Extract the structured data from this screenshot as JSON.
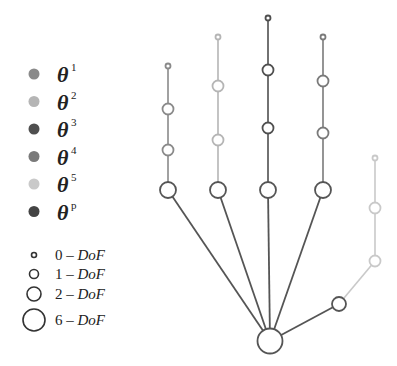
{
  "legend": {
    "colors": [
      {
        "label": "θ",
        "sup": "1",
        "color": "#8a8a8a"
      },
      {
        "label": "θ",
        "sup": "2",
        "color": "#b5b5b5"
      },
      {
        "label": "θ",
        "sup": "3",
        "color": "#4f4f4f"
      },
      {
        "label": "θ",
        "sup": "4",
        "color": "#7a7a7a"
      },
      {
        "label": "θ",
        "sup": "5",
        "color": "#c9c9c9"
      },
      {
        "label": "θ",
        "sup": "p",
        "color": "#444444"
      }
    ],
    "dof": [
      {
        "num": "0",
        "dash": "–",
        "label": "DoF",
        "radius": 2.5
      },
      {
        "num": "1",
        "dash": "–",
        "label": "DoF",
        "radius": 4.5
      },
      {
        "num": "2",
        "dash": "–",
        "label": "DoF",
        "radius": 7
      },
      {
        "num": "6",
        "dash": "–",
        "label": "DoF",
        "radius": 11
      }
    ]
  },
  "hand": {
    "palm": {
      "x": 270,
      "y": 341,
      "r": 12.5,
      "color": "#555555"
    },
    "fingers": [
      {
        "name": "finger-1",
        "color": "#8a8a8a",
        "nodes": [
          [
            168,
            190,
            8
          ],
          [
            168,
            150,
            5.5
          ],
          [
            168,
            109,
            5.5
          ],
          [
            168,
            66,
            2.5
          ]
        ]
      },
      {
        "name": "finger-2",
        "color": "#b5b5b5",
        "nodes": [
          [
            218,
            190,
            8
          ],
          [
            218,
            140,
            5.5
          ],
          [
            218,
            86,
            5.5
          ],
          [
            218,
            37,
            2.5
          ]
        ]
      },
      {
        "name": "finger-3",
        "color": "#4f4f4f",
        "nodes": [
          [
            268,
            190,
            8
          ],
          [
            268,
            128,
            5.5
          ],
          [
            268,
            70,
            5.5
          ],
          [
            268,
            18,
            2.5
          ]
        ]
      },
      {
        "name": "finger-4",
        "color": "#7a7a7a",
        "nodes": [
          [
            323,
            190,
            8
          ],
          [
            323,
            133,
            5.5
          ],
          [
            323,
            81,
            5.5
          ],
          [
            323,
            37,
            2.5
          ]
        ]
      },
      {
        "name": "thumb",
        "color": "#c9c9c9",
        "nodes": [
          [
            339,
            304,
            7
          ],
          [
            375,
            261,
            5.5
          ],
          [
            375,
            208,
            5.5
          ],
          [
            375,
            158,
            2.5
          ]
        ]
      }
    ]
  }
}
